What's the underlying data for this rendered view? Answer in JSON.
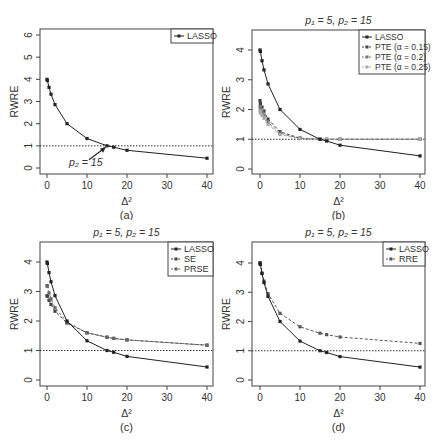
{
  "chart_data": [
    {
      "id": "a",
      "type": "line",
      "caption": "(a)",
      "title": "",
      "xlabel": "Δ²",
      "ylabel": "RWRE",
      "xlim": [
        0,
        40
      ],
      "ylim": [
        0,
        6
      ],
      "xticks": [
        0,
        10,
        20,
        30,
        40
      ],
      "yticks": [
        0,
        1,
        2,
        3,
        4,
        5,
        6
      ],
      "reference_line": 1,
      "annotation": {
        "text": "p₂ = 15",
        "x": 15,
        "y": 1.0
      },
      "legend": {
        "position": "top-right",
        "entries": [
          "LASSO"
        ]
      },
      "x": [
        0,
        0.1,
        0.5,
        1,
        2,
        5,
        10,
        15,
        16.67,
        20,
        40
      ],
      "series": [
        {
          "name": "LASSO",
          "style": "solid",
          "color": "#222222",
          "values": [
            4.0,
            3.95,
            3.64,
            3.33,
            2.86,
            2.0,
            1.33,
            1.0,
            0.94,
            0.8,
            0.44
          ]
        }
      ]
    },
    {
      "id": "b",
      "type": "line",
      "caption": "(b)",
      "title": "p₁ = 5, p₂ = 15",
      "xlabel": "Δ²",
      "ylabel": "RWRE",
      "xlim": [
        0,
        40
      ],
      "ylim": [
        0,
        4.5
      ],
      "xticks": [
        0,
        10,
        20,
        30,
        40
      ],
      "yticks": [
        0,
        1,
        2,
        3,
        4
      ],
      "reference_line": 1,
      "legend": {
        "position": "top-right",
        "entries": [
          "LASSO",
          "PTE (α = 0.15)",
          "PTE (α = 0.2)",
          "PTE (α = 0.25)"
        ]
      },
      "x": [
        0,
        0.1,
        0.5,
        1,
        2,
        5,
        10,
        15,
        16.67,
        20,
        40
      ],
      "series": [
        {
          "name": "LASSO",
          "style": "solid",
          "color": "#222222",
          "values": [
            4.0,
            3.95,
            3.64,
            3.33,
            2.86,
            2.0,
            1.33,
            1.0,
            0.94,
            0.8,
            0.44
          ]
        },
        {
          "name": "PTE (α = 0.15)",
          "style": "dashed",
          "color": "#444444",
          "values": [
            2.3,
            2.2,
            2.08,
            1.95,
            1.68,
            1.25,
            1.04,
            1.0,
            1.0,
            1.0,
            1.0
          ]
        },
        {
          "name": "PTE (α = 0.2)",
          "style": "dashed",
          "color": "#777777",
          "values": [
            2.1,
            2.02,
            1.92,
            1.82,
            1.58,
            1.2,
            1.03,
            1.0,
            1.0,
            1.0,
            1.0
          ]
        },
        {
          "name": "PTE (α = 0.25)",
          "style": "dashed",
          "color": "#aaaaaa",
          "values": [
            1.95,
            1.88,
            1.8,
            1.7,
            1.5,
            1.16,
            1.02,
            1.0,
            1.0,
            1.0,
            1.0
          ]
        }
      ]
    },
    {
      "id": "c",
      "type": "line",
      "caption": "(c)",
      "title": "p₁ = 5, p₂ = 15",
      "xlabel": "Δ²",
      "ylabel": "RWRE",
      "xlim": [
        0,
        40
      ],
      "ylim": [
        0,
        4.5
      ],
      "xticks": [
        0,
        10,
        20,
        30,
        40
      ],
      "yticks": [
        0,
        1,
        2,
        3,
        4
      ],
      "reference_line": 1,
      "legend": {
        "position": "top-right",
        "entries": [
          "LASSO",
          "SE",
          "PRSE"
        ]
      },
      "x": [
        0,
        0.1,
        0.5,
        1,
        2,
        5,
        10,
        15,
        16.67,
        20,
        40
      ],
      "series": [
        {
          "name": "LASSO",
          "style": "solid",
          "color": "#222222",
          "values": [
            4.0,
            3.95,
            3.64,
            3.33,
            2.86,
            2.0,
            1.33,
            1.0,
            0.94,
            0.8,
            0.44
          ]
        },
        {
          "name": "SE",
          "style": "dashed",
          "color": "#444444",
          "values": [
            2.86,
            2.84,
            2.7,
            2.56,
            2.33,
            1.93,
            1.6,
            1.45,
            1.41,
            1.36,
            1.18
          ]
        },
        {
          "name": "PRSE",
          "style": "dashed",
          "color": "#666666",
          "values": [
            3.2,
            3.18,
            2.95,
            2.75,
            2.45,
            1.96,
            1.6,
            1.45,
            1.41,
            1.36,
            1.18
          ]
        }
      ]
    },
    {
      "id": "d",
      "type": "line",
      "caption": "(d)",
      "title": "p₁ = 5, p₂ = 15",
      "xlabel": "Δ²",
      "ylabel": "RWRE",
      "xlim": [
        0,
        40
      ],
      "ylim": [
        0,
        4.5
      ],
      "xticks": [
        0,
        10,
        20,
        30,
        40
      ],
      "yticks": [
        0,
        1,
        2,
        3,
        4
      ],
      "reference_line": 1,
      "legend": {
        "position": "top-right",
        "entries": [
          "LASSO",
          "RRE"
        ]
      },
      "x": [
        0,
        0.1,
        0.5,
        1,
        2,
        5,
        10,
        15,
        16.67,
        20,
        40
      ],
      "series": [
        {
          "name": "LASSO",
          "style": "solid",
          "color": "#222222",
          "values": [
            4.0,
            3.95,
            3.64,
            3.33,
            2.86,
            2.0,
            1.33,
            1.0,
            0.94,
            0.8,
            0.44
          ]
        },
        {
          "name": "RRE",
          "style": "dashed",
          "color": "#555555",
          "values": [
            4.0,
            3.96,
            3.66,
            3.38,
            2.95,
            2.28,
            1.82,
            1.6,
            1.55,
            1.47,
            1.25
          ]
        }
      ]
    }
  ]
}
